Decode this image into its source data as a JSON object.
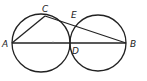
{
  "diagram": {
    "type": "geometry",
    "points": [
      {
        "id": "A",
        "label": "A",
        "x": 12,
        "y": 43,
        "lx": 2,
        "ly": 47
      },
      {
        "id": "C",
        "label": "C",
        "x": 45,
        "y": 16,
        "lx": 42,
        "ly": 12
      },
      {
        "id": "E",
        "label": "E",
        "x": 75,
        "y": 23,
        "lx": 71,
        "ly": 18
      },
      {
        "id": "D",
        "label": "D",
        "x": 70,
        "y": 43,
        "lx": 72,
        "ly": 54
      },
      {
        "id": "B",
        "label": "B",
        "x": 126,
        "y": 43,
        "lx": 130,
        "ly": 47
      }
    ],
    "circles": [
      {
        "id": "left-circle",
        "cx": 41,
        "cy": 43,
        "r": 29
      },
      {
        "id": "right-circle",
        "cx": 98,
        "cy": 43,
        "r": 28
      }
    ],
    "segments": [
      {
        "id": "AB",
        "from": "A",
        "to": "B"
      },
      {
        "id": "AC",
        "from": "A",
        "to": "C"
      },
      {
        "id": "CB",
        "from": "C",
        "to": "B"
      }
    ],
    "labels": {
      "A": "A",
      "B": "B",
      "C": "C",
      "D": "D",
      "E": "E"
    }
  }
}
